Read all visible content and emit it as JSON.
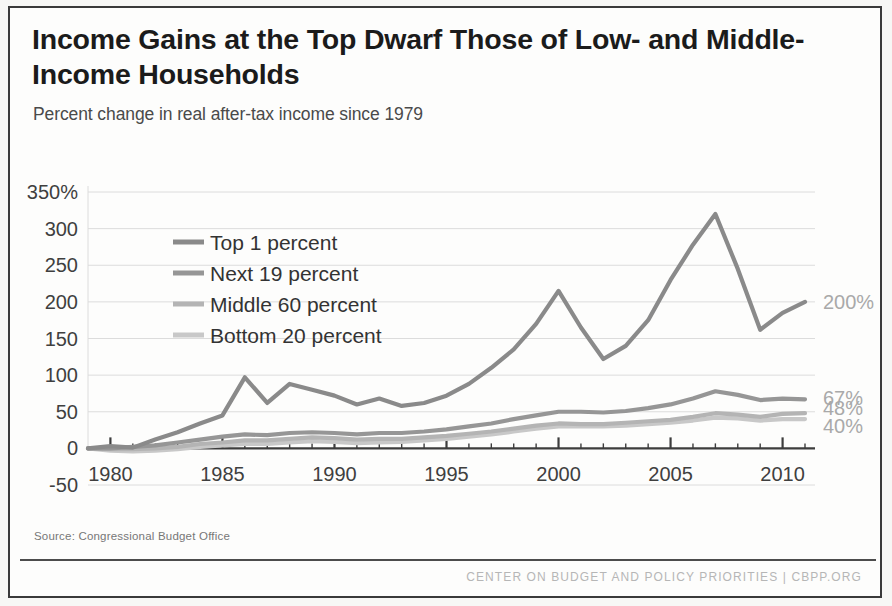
{
  "title": "Income Gains at the Top Dwarf Those of Low- and Middle-Income Households",
  "subtitle": "Percent change in real after-tax income since 1979",
  "source": "Source: Congressional Budget Office",
  "footer": "CENTER ON BUDGET AND POLICY PRIORITIES | CBPP.ORG",
  "colors": {
    "top1": "#8a8a8a",
    "next19": "#969696",
    "middle60": "#b4b4b4",
    "bottom20": "#c8c8c8",
    "axis": "#3d3d3d",
    "grid": "#dcdcdc",
    "end_label": "#a9a9a9",
    "title": "#1b1b1b"
  },
  "chart_data": {
    "type": "line",
    "title": "Income Gains at the Top Dwarf Those of Low- and Middle-Income Households",
    "subtitle": "Percent change in real after-tax income since 1979",
    "xlabel": "",
    "ylabel": "Percent change in real after-tax income since 1979",
    "xlim": [
      1979,
      2011
    ],
    "ylim": [
      -50,
      350
    ],
    "ytick_labels": [
      "350%",
      "300",
      "250",
      "200",
      "150",
      "100",
      "50",
      "0",
      "-50"
    ],
    "yticks": [
      350,
      300,
      250,
      200,
      150,
      100,
      50,
      0,
      -50
    ],
    "xticks": [
      1980,
      1985,
      1990,
      1995,
      2000,
      2005,
      2010
    ],
    "xtick_labels": [
      "1980",
      "1985",
      "1990",
      "1995",
      "2000",
      "2005",
      "2010"
    ],
    "x_minor_tick_interval": 1,
    "grid": "horizontal",
    "legend_position": "upper-left-inside",
    "x": [
      1979,
      1980,
      1981,
      1982,
      1983,
      1984,
      1985,
      1986,
      1987,
      1988,
      1989,
      1990,
      1991,
      1992,
      1993,
      1994,
      1995,
      1996,
      1997,
      1998,
      1999,
      2000,
      2001,
      2002,
      2003,
      2004,
      2005,
      2006,
      2007,
      2008,
      2009,
      2010,
      2011
    ],
    "series": [
      {
        "name": "Top 1 percent",
        "color": "#8a8a8a",
        "end_label": "200%",
        "values": [
          0,
          3,
          1,
          12,
          22,
          34,
          45,
          97,
          62,
          88,
          80,
          72,
          60,
          68,
          58,
          62,
          72,
          88,
          110,
          135,
          170,
          215,
          165,
          122,
          140,
          175,
          230,
          278,
          320,
          245,
          162,
          185,
          200
        ]
      },
      {
        "name": "Next 19 percent",
        "color": "#969696",
        "end_label": "67%",
        "values": [
          0,
          0,
          2,
          4,
          8,
          12,
          16,
          19,
          18,
          21,
          22,
          21,
          19,
          21,
          21,
          23,
          26,
          30,
          34,
          40,
          45,
          50,
          50,
          49,
          51,
          55,
          60,
          68,
          78,
          73,
          66,
          68,
          67
        ]
      },
      {
        "name": "Middle 60 percent",
        "color": "#b4b4b4",
        "end_label": "48%",
        "values": [
          0,
          -1,
          -1,
          0,
          2,
          6,
          8,
          11,
          11,
          13,
          15,
          14,
          12,
          13,
          13,
          15,
          17,
          20,
          23,
          27,
          31,
          34,
          33,
          33,
          35,
          37,
          39,
          43,
          48,
          46,
          43,
          47,
          48
        ]
      },
      {
        "name": "Bottom 20 percent",
        "color": "#c8c8c8",
        "end_label": "40%",
        "values": [
          0,
          -3,
          -4,
          -3,
          -1,
          2,
          4,
          6,
          6,
          8,
          10,
          9,
          7,
          8,
          9,
          11,
          13,
          16,
          19,
          23,
          27,
          30,
          30,
          30,
          31,
          33,
          35,
          38,
          42,
          41,
          38,
          40,
          40
        ]
      }
    ],
    "legend": [
      {
        "label": "Top 1 percent",
        "color": "#8a8a8a"
      },
      {
        "label": "Next 19 percent",
        "color": "#969696"
      },
      {
        "label": "Middle 60 percent",
        "color": "#b4b4b4"
      },
      {
        "label": "Bottom 20 percent",
        "color": "#c8c8c8"
      }
    ]
  }
}
